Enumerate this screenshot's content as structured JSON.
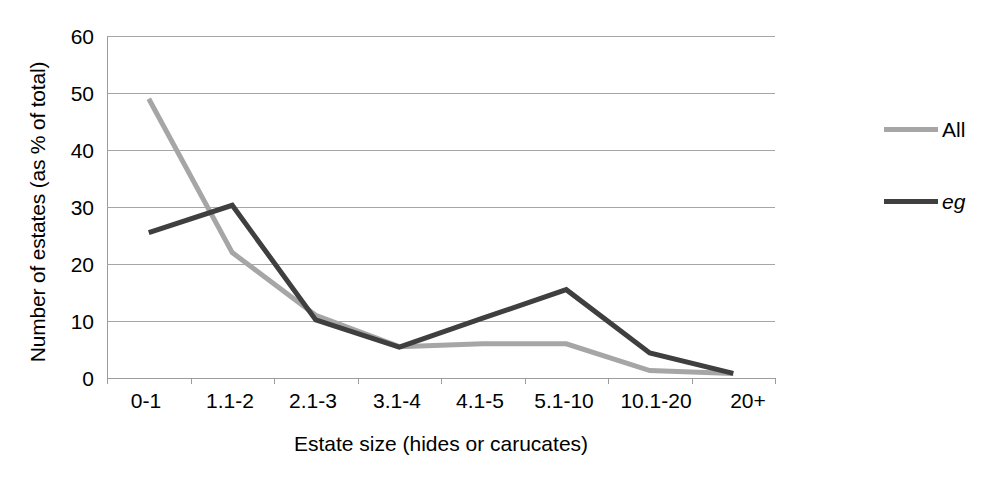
{
  "chart_data": {
    "type": "line",
    "title": "",
    "xlabel": "Estate size (hides or carucates)",
    "ylabel": "Number of estates (as % of total)",
    "categories": [
      "0-1",
      "1.1-2",
      "2.1-3",
      "3.1-4",
      "4.1-5",
      "5.1-10",
      "10.1-20",
      "20+"
    ],
    "ylim": [
      0,
      60
    ],
    "yticks": [
      "0",
      "10",
      "20",
      "30",
      "40",
      "50",
      "60"
    ],
    "grid": true,
    "legend_position": "right",
    "series": [
      {
        "name": "All",
        "color": "#a6a6a6",
        "italic": false,
        "values": [
          49,
          22,
          11,
          5.5,
          6,
          6,
          1.3,
          0.8
        ]
      },
      {
        "name": "eg",
        "color": "#3f3f3f",
        "italic": true,
        "values": [
          25.5,
          30.3,
          10.2,
          5.4,
          10.5,
          15.5,
          4.4,
          0.8
        ]
      }
    ]
  },
  "legend": {
    "items": [
      {
        "label": "All"
      },
      {
        "label": "eg"
      }
    ]
  }
}
